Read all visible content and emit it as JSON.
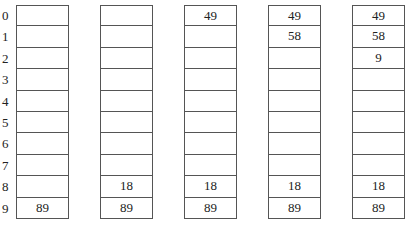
{
  "indices": [
    "0",
    "1",
    "2",
    "3",
    "4",
    "5",
    "6",
    "7",
    "8",
    "9"
  ],
  "columns": [
    {
      "cells": [
        "",
        "",
        "",
        "",
        "",
        "",
        "",
        "",
        "",
        "89"
      ]
    },
    {
      "cells": [
        "",
        "",
        "",
        "",
        "",
        "",
        "",
        "",
        "18",
        "89"
      ]
    },
    {
      "cells": [
        "49",
        "",
        "",
        "",
        "",
        "",
        "",
        "",
        "18",
        "89"
      ]
    },
    {
      "cells": [
        "49",
        "58",
        "",
        "",
        "",
        "",
        "",
        "",
        "18",
        "89"
      ]
    },
    {
      "cells": [
        "49",
        "58",
        "9",
        "",
        "",
        "",
        "",
        "",
        "18",
        "89"
      ]
    }
  ]
}
